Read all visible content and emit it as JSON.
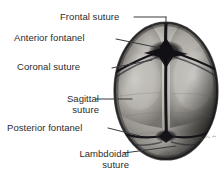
{
  "figure": {
    "background_color": "#ffffff",
    "text_color": "#2b2b2b",
    "skull": {
      "description": "Grayscale photographic superior view of a neonatal cranium",
      "center_x": 166,
      "center_y": 91,
      "radius_x": 52,
      "radius_y": 69,
      "fill_light": "#d8d5d0",
      "fill_mid": "#9d9a94",
      "fill_dark": "#3a3835",
      "suture_color": "#17161a"
    },
    "leader_line_color": "#3a3a3a",
    "signature": "artist-signature"
  },
  "labels": [
    {
      "id": "frontal-suture",
      "text": "Frontal suture",
      "lines": [
        "Frontal suture"
      ]
    },
    {
      "id": "anterior-fontanel",
      "text": "Anterior fontanel",
      "lines": [
        "Anterior fontanel"
      ]
    },
    {
      "id": "coronal-suture",
      "text": "Coronal suture",
      "lines": [
        "Coronal suture"
      ]
    },
    {
      "id": "sagittal-suture",
      "text": "Sagittal suture",
      "lines": [
        "Sagittal",
        "suture"
      ]
    },
    {
      "id": "posterior-fontanel",
      "text": "Posterior fontanel",
      "lines": [
        "Posterior fontanel"
      ]
    },
    {
      "id": "lambdoidal-suture",
      "text": "Lambdoidal suture",
      "lines": [
        "Lambdoidal",
        "suture"
      ]
    }
  ],
  "label_text": {
    "frontal_suture": "Frontal suture",
    "anterior_fontanel": "Anterior fontanel",
    "coronal_suture": "Coronal suture",
    "sagittal_line1": "Sagittal",
    "sagittal_line2": "suture",
    "posterior_fontanel": "Posterior fontanel",
    "lambdoidal_line1": "Lambdoidal",
    "lambdoidal_line2": "suture"
  }
}
